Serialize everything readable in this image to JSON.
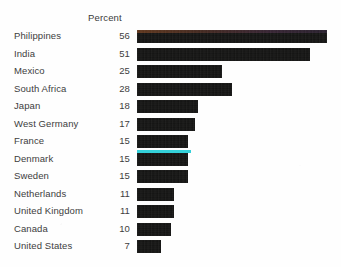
{
  "header": {
    "axis_title": "Percent"
  },
  "colors": {
    "bar": "#111110",
    "background": "#fefefe",
    "text": "#3d3d3d",
    "scan_artifact": "#29cfd8"
  },
  "chart_data": {
    "type": "bar",
    "orientation": "horizontal",
    "title": "",
    "subtitle": "",
    "xlabel": "Percent",
    "ylabel": "",
    "grid": false,
    "legend": null,
    "xlim": [
      0,
      56
    ],
    "value_suffix": "",
    "categories": [
      "Philippines",
      "India",
      "Mexico",
      "South Africa",
      "Japan",
      "West Germany",
      "France",
      "Denmark",
      "Sweden",
      "Netherlands",
      "United Kingdom",
      "Canada",
      "United States"
    ],
    "values": [
      56,
      51,
      25,
      28,
      18,
      17,
      15,
      15,
      15,
      11,
      11,
      10,
      7
    ],
    "value_labels": [
      "56",
      "51",
      "25",
      "28",
      "18",
      "17",
      "15",
      "15",
      "15",
      "11",
      "11",
      "10",
      "7"
    ],
    "annotations": [
      "cyan scanner artifact line across the France and Denmark bars"
    ]
  }
}
